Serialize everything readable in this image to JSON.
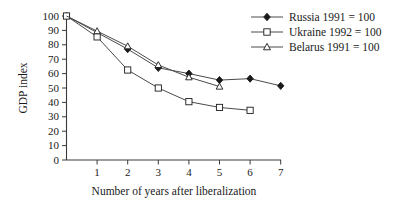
{
  "chart_data": {
    "type": "line",
    "title": "",
    "xlabel": "Number of years after liberalization",
    "ylabel": "GDP index",
    "xlim": [
      0,
      7
    ],
    "ylim": [
      0,
      100
    ],
    "xticks": [
      "1",
      "2",
      "3",
      "4",
      "5",
      "6",
      "7"
    ],
    "yticks": [
      "0",
      "10",
      "20",
      "30",
      "40",
      "50",
      "60",
      "70",
      "80",
      "90",
      "100"
    ],
    "grid": false,
    "legend_position": "top-right",
    "series": [
      {
        "name": "Russia 1991 = 100",
        "marker": "filled-diamond",
        "color": "#1a1a1a",
        "x": [
          0,
          1,
          2,
          3,
          4,
          5,
          6,
          7
        ],
        "values": [
          100,
          88.5,
          77,
          64,
          60,
          55.5,
          56.5,
          51.5
        ],
        "markers_shown_at": [
          0,
          2,
          3,
          4,
          5,
          6,
          7
        ]
      },
      {
        "name": "Ukraine 1992 = 100",
        "marker": "open-square",
        "color": "#1a1a1a",
        "x": [
          0,
          1,
          2,
          3,
          4,
          5,
          6
        ],
        "values": [
          100,
          85.5,
          62.5,
          50,
          40.5,
          36.5,
          34.5
        ],
        "markers_shown_at": [
          0,
          1,
          2,
          3,
          4,
          5,
          6
        ]
      },
      {
        "name": "Belarus 1991 = 100",
        "marker": "open-triangle",
        "color": "#1a1a1a",
        "x": [
          0,
          1,
          2,
          3,
          4,
          5
        ],
        "values": [
          100,
          89.5,
          79,
          66,
          57.5,
          51
        ],
        "markers_shown_at": [
          1,
          2,
          3,
          4,
          5
        ]
      }
    ]
  },
  "legend": {
    "entries": [
      {
        "label": "Russia 1991 = 100"
      },
      {
        "label": "Ukraine 1992 = 100"
      },
      {
        "label": "Belarus 1991 = 100"
      }
    ]
  },
  "axes": {
    "y_title": "GDP index",
    "x_title": "Number of years after liberalization"
  }
}
